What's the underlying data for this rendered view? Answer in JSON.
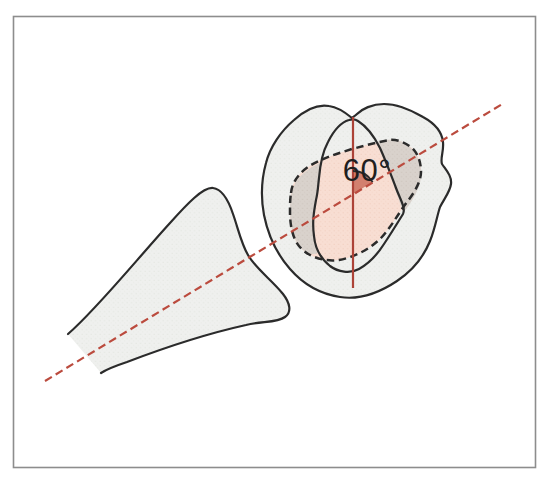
{
  "figure": {
    "angle_label": "60°",
    "elements": {
      "frame": "thin gray border frame",
      "shaft": "bone shaft cross-section outline (lower left)",
      "head_outer": "outer bone-head contour (upper right)",
      "head_inner": "inner ridge contour inside the head",
      "contact_area": "dashed contact-area outline with pink shading",
      "long_axis": "red dashed oblique axis line",
      "vertical_axis": "red solid vertical reference line",
      "angle_marker": "shaded wedge with arc marking the angle"
    }
  },
  "colors": {
    "background": "#ffffff",
    "frame_border": "#8d8d8d",
    "outline_dark": "#2b2b2b",
    "bone_fill": "#eff0ee",
    "contact_fill_pink": "#f8ded3",
    "overlap_fill_gray": "#d9d2cc",
    "angle_wedge_fill": "#d2806f",
    "axis_red_solid": "#ad4338",
    "axis_red_dashed": "#bb4b3e",
    "angle_text": "#1f1f1f"
  }
}
